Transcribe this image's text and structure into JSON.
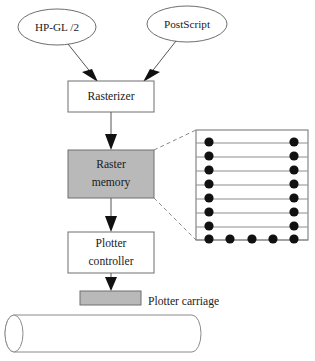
{
  "diagram": {
    "colors": {
      "fill_gray": "#b9b9b9",
      "stroke_gray": "#6e6e6e",
      "line_gray": "#8a8a8a",
      "arrow_black": "#111111",
      "text_black": "#1a1a1a",
      "background": "#ffffff"
    },
    "inputs": [
      {
        "id": "hpgl2",
        "label": "HP-GL /2",
        "shape": "ellipse",
        "cx": 57,
        "cy": 27,
        "rx": 39,
        "ry": 18
      },
      {
        "id": "postscript",
        "label": "PostScript",
        "shape": "ellipse",
        "cx": 187,
        "cy": 24,
        "rx": 40,
        "ry": 18
      }
    ],
    "boxes": [
      {
        "id": "rasterizer",
        "lines": [
          "Rasterizer"
        ],
        "fill": "white",
        "x": 68,
        "y": 81,
        "w": 86,
        "h": 31
      },
      {
        "id": "raster-memory",
        "lines": [
          "Raster",
          "memory"
        ],
        "fill": "gray",
        "x": 68,
        "y": 150,
        "w": 86,
        "h": 48
      },
      {
        "id": "plotter-controller",
        "lines": [
          "Plotter",
          "controller"
        ],
        "fill": "white",
        "x": 68,
        "y": 232,
        "w": 86,
        "h": 41
      },
      {
        "id": "plotter-carriage",
        "lines": [],
        "fill": "gray",
        "x": 80,
        "y": 291,
        "w": 61,
        "h": 14
      }
    ],
    "labels": [
      {
        "id": "plotter-carriage-label",
        "text": "Plotter carriage",
        "x": 148,
        "y": 298
      }
    ],
    "arrows": [
      {
        "id": "hpgl2-to-rasterizer",
        "from": "hpgl2",
        "to": "rasterizer",
        "kind": "diagonal"
      },
      {
        "id": "postscript-to-rasterizer",
        "from": "postscript",
        "to": "rasterizer",
        "kind": "diagonal"
      },
      {
        "id": "rasterizer-to-raster-memory",
        "from": "rasterizer",
        "to": "raster-memory",
        "kind": "vertical"
      },
      {
        "id": "raster-memory-to-plotter-controller",
        "from": "raster-memory",
        "to": "plotter-controller",
        "kind": "vertical"
      },
      {
        "id": "plotter-controller-to-carriage",
        "from": "plotter-controller",
        "to": "plotter-carriage",
        "kind": "vertical"
      }
    ],
    "callout": {
      "id": "raster-memory-detail",
      "source": "raster-memory",
      "style": "dashed",
      "description": "Dashed leader lines expanding the raster memory into a scanline grid"
    },
    "grid_detail": {
      "id": "raster-grid",
      "x": 196,
      "y": 130,
      "w": 112,
      "h": 110,
      "rows": 8,
      "row_dots": [
        {
          "row": 1,
          "dots": [
            0,
            4
          ]
        },
        {
          "row": 2,
          "dots": [
            0,
            4
          ]
        },
        {
          "row": 3,
          "dots": [
            0,
            4
          ]
        },
        {
          "row": 4,
          "dots": [
            0,
            4
          ]
        },
        {
          "row": 5,
          "dots": [
            0,
            4
          ]
        },
        {
          "row": 6,
          "dots": [
            0,
            4
          ]
        },
        {
          "row": 7,
          "dots": [
            0,
            4
          ]
        },
        {
          "row": 8,
          "dots": [
            0,
            1,
            2,
            3,
            4
          ]
        }
      ],
      "columns": 5,
      "dot_radius": 4.6
    },
    "drum": {
      "id": "plotter-drum",
      "x": 5,
      "y": 315,
      "w": 196,
      "h": 37,
      "cap_rx": 9
    }
  }
}
